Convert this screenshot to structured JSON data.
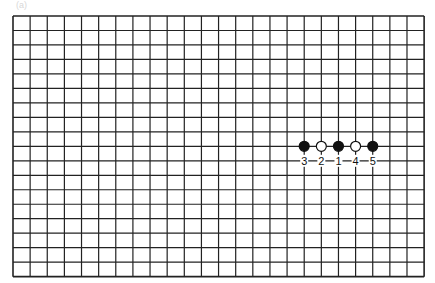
{
  "panel_label": "(a)",
  "grid": {
    "left": 13,
    "top": 16,
    "cols": 24,
    "rows": 18,
    "cell_w": 17.13,
    "cell_h": 14.48,
    "line_color": "#222222",
    "background": "#ffffff"
  },
  "stones": [
    {
      "label": "3",
      "fill": "black",
      "col": 17,
      "row": 9
    },
    {
      "label": "2",
      "fill": "white",
      "col": 18,
      "row": 9
    },
    {
      "label": "1",
      "fill": "black",
      "col": 19,
      "row": 9
    },
    {
      "label": "4",
      "fill": "white",
      "col": 20,
      "row": 9
    },
    {
      "label": "5",
      "fill": "black",
      "col": 21,
      "row": 9
    }
  ]
}
